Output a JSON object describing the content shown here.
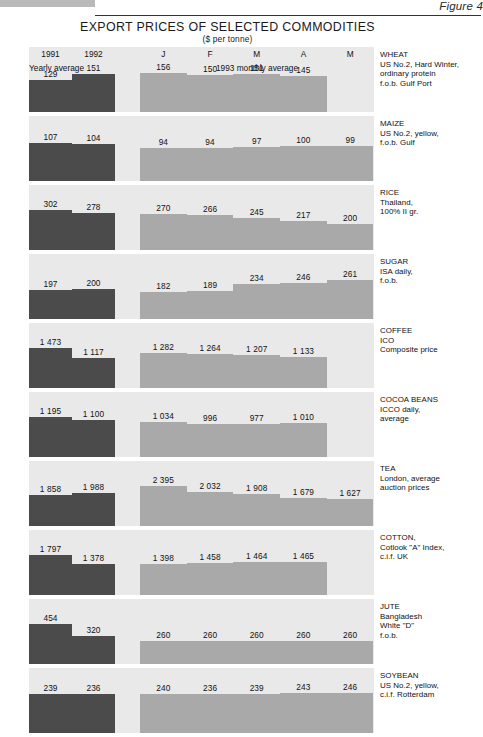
{
  "figure_caption": "Figure 4",
  "title": "EXPORT PRICES OF SELECTED COMMODITIES",
  "subtitle": "($ per tonne)",
  "axis": {
    "yearly_ticks": [
      "1991",
      "1992"
    ],
    "monthly_ticks": [
      "J",
      "F",
      "M",
      "A",
      "M"
    ],
    "yearly_group_label": "Yearly average",
    "monthly_group_label": "1993 monthly average"
  },
  "colors": {
    "yearly_bar": "#4b4b4b",
    "monthly_bar": "#a9a9a9",
    "panel_background": "#e9e9e9",
    "page_background": "#ffffff",
    "text": "#111111"
  },
  "chart_data": {
    "type": "bar",
    "title": "EXPORT PRICES OF SELECTED COMMODITIES",
    "subtitle": "($ per tonne)",
    "xlabel": "",
    "ylabel": "$ per tonne",
    "grid": false,
    "legend_position": "none",
    "categories": [
      "1991",
      "1992",
      "J",
      "F",
      "M",
      "A",
      "M"
    ],
    "series_note": "First two categories are yearly averages (dark bars); remaining five are 1993 monthly averages (light bars).",
    "panels": [
      {
        "name": "WHEAT",
        "desc": [
          "US No.2, Hard Winter,",
          "ordinary protein",
          "f.o.b. Gulf Port"
        ],
        "yearly": [
          {
            "label": "1991",
            "value": 129
          },
          {
            "label": "1992",
            "value": 151
          }
        ],
        "monthly": [
          {
            "label": "J",
            "value": 156
          },
          {
            "label": "F",
            "value": 150
          },
          {
            "label": "M",
            "value": 151
          },
          {
            "label": "A",
            "value": 145
          }
        ],
        "axis_max": 205
      },
      {
        "name": "MAIZE",
        "desc": [
          "US No.2, yellow,",
          "f.o.b. Gulf"
        ],
        "yearly": [
          {
            "label": "1991",
            "value": 107
          },
          {
            "label": "1992",
            "value": 104
          }
        ],
        "monthly": [
          {
            "label": "J",
            "value": 94
          },
          {
            "label": "F",
            "value": 94
          },
          {
            "label": "M",
            "value": 97
          },
          {
            "label": "A",
            "value": 100
          },
          {
            "label": "M",
            "value": 99
          }
        ],
        "axis_max": 145
      },
      {
        "name": "RICE",
        "desc": [
          "Thailand,",
          "100% II gr."
        ],
        "yearly": [
          {
            "label": "1991",
            "value": 302
          },
          {
            "label": "1992",
            "value": 278
          }
        ],
        "monthly": [
          {
            "label": "J",
            "value": 270
          },
          {
            "label": "F",
            "value": 266
          },
          {
            "label": "M",
            "value": 245
          },
          {
            "label": "A",
            "value": 217
          },
          {
            "label": "M",
            "value": 200
          }
        ],
        "axis_max": 385
      },
      {
        "name": "SUGAR",
        "desc": [
          "ISA daily,",
          "f.o.b."
        ],
        "yearly": [
          {
            "label": "1991",
            "value": 197
          },
          {
            "label": "1992",
            "value": 200
          }
        ],
        "monthly": [
          {
            "label": "J",
            "value": 182
          },
          {
            "label": "F",
            "value": 189
          },
          {
            "label": "M",
            "value": 234
          },
          {
            "label": "A",
            "value": 246
          },
          {
            "label": "M",
            "value": 261
          }
        ],
        "axis_max": 345
      },
      {
        "name": "COFFEE",
        "desc": [
          "ICO",
          "Composite price"
        ],
        "yearly": [
          {
            "label": "1991",
            "value": 1473
          },
          {
            "label": "1992",
            "value": 1117
          }
        ],
        "monthly": [
          {
            "label": "J",
            "value": 1282
          },
          {
            "label": "F",
            "value": 1264
          },
          {
            "label": "M",
            "value": 1207
          },
          {
            "label": "A",
            "value": 1133
          }
        ],
        "axis_max": 1880
      },
      {
        "name": "COCOA BEANS",
        "desc": [
          "ICCO daily,",
          "average"
        ],
        "yearly": [
          {
            "label": "1991",
            "value": 1195
          },
          {
            "label": "1992",
            "value": 1100
          }
        ],
        "monthly": [
          {
            "label": "J",
            "value": 1034
          },
          {
            "label": "F",
            "value": 996
          },
          {
            "label": "M",
            "value": 977
          },
          {
            "label": "A",
            "value": 1010
          }
        ],
        "axis_max": 1525
      },
      {
        "name": "TEA",
        "desc": [
          "London, average",
          "auction prices"
        ],
        "yearly": [
          {
            "label": "1991",
            "value": 1858
          },
          {
            "label": "1992",
            "value": 1988
          }
        ],
        "monthly": [
          {
            "label": "J",
            "value": 2395
          },
          {
            "label": "F",
            "value": 2032
          },
          {
            "label": "M",
            "value": 1908
          },
          {
            "label": "A",
            "value": 1679
          },
          {
            "label": "M",
            "value": 1627
          }
        ],
        "axis_max": 3060
      },
      {
        "name": "COTTON,",
        "desc": [
          "Cotlook \"A\" Index,",
          "c.i.f. UK"
        ],
        "yearly": [
          {
            "label": "1991",
            "value": 1797
          },
          {
            "label": "1992",
            "value": 1378
          }
        ],
        "monthly": [
          {
            "label": "J",
            "value": 1398
          },
          {
            "label": "F",
            "value": 1458
          },
          {
            "label": "M",
            "value": 1464
          },
          {
            "label": "A",
            "value": 1465
          }
        ],
        "axis_max": 2295
      },
      {
        "name": "JUTE",
        "desc": [
          "Bangladesh",
          "White \"D\"",
          "f.o.b."
        ],
        "yearly": [
          {
            "label": "1991",
            "value": 454
          },
          {
            "label": "1992",
            "value": 320
          }
        ],
        "monthly": [
          {
            "label": "J",
            "value": 260
          },
          {
            "label": "F",
            "value": 260
          },
          {
            "label": "M",
            "value": 260
          },
          {
            "label": "A",
            "value": 260
          },
          {
            "label": "M",
            "value": 260
          }
        ],
        "axis_max": 580
      },
      {
        "name": "SOYBEAN",
        "desc": [
          "US No.2, yellow,",
          "c.i.f. Rotterdam"
        ],
        "yearly": [
          {
            "label": "1991",
            "value": 239
          },
          {
            "label": "1992",
            "value": 236
          }
        ],
        "monthly": [
          {
            "label": "J",
            "value": 240
          },
          {
            "label": "F",
            "value": 236
          },
          {
            "label": "M",
            "value": 239
          },
          {
            "label": "A",
            "value": 243
          },
          {
            "label": "M",
            "value": 246
          }
        ],
        "axis_max": 312
      }
    ]
  }
}
